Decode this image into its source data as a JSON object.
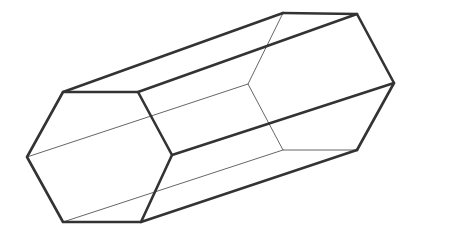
{
  "figure": {
    "shape_name": "hexagonal-prism",
    "background_color": "#ffffff",
    "visible_edge_color": "#333333",
    "hidden_edge_color": "#555555",
    "visible_edge_width": 2.6,
    "hidden_edge_width": 0.9,
    "canvas": {
      "width": 452,
      "height": 235
    },
    "vertices": {
      "near_hexagon": {
        "label": "near-end-hexagon",
        "points": [
          {
            "name": "near-top-left",
            "x": 63,
            "y": 92
          },
          {
            "name": "near-top-right",
            "x": 138,
            "y": 92
          },
          {
            "name": "near-right",
            "x": 172,
            "y": 155
          },
          {
            "name": "near-bottom-right",
            "x": 141,
            "y": 222
          },
          {
            "name": "near-bottom-left",
            "x": 63,
            "y": 222
          },
          {
            "name": "near-left",
            "x": 27,
            "y": 157
          }
        ]
      },
      "far_hexagon": {
        "label": "far-end-hexagon",
        "points": [
          {
            "name": "far-top-left",
            "x": 283,
            "y": 13
          },
          {
            "name": "far-top-right",
            "x": 357,
            "y": 14
          },
          {
            "name": "far-right",
            "x": 394,
            "y": 83
          },
          {
            "name": "far-bottom-right",
            "x": 357,
            "y": 150
          },
          {
            "name": "far-bottom-left",
            "x": 283,
            "y": 150
          },
          {
            "name": "far-left",
            "x": 248,
            "y": 84
          }
        ]
      }
    },
    "edges": {
      "near_face_visible": "M 63,92 L 138,92 L 172,155 L 141,222 L 63,222 L 27,157 Z",
      "far_face_visible": "M 283,13 L 357,14 L 394,83 L 357,150",
      "far_face_hidden": "M 283,13 L 248,84 L 283,150 L 357,150",
      "connector_top_left": "M 63,92 L 283,13",
      "connector_top_right": "M 138,92 L 357,14",
      "connector_right": "M 172,155 L 394,83",
      "connector_bottom_right": "M 141,222 L 357,150",
      "connector_bottom_left_hidden": "M 63,222 L 283,150",
      "connector_left_hidden": "M 27,157 L 248,84"
    }
  }
}
